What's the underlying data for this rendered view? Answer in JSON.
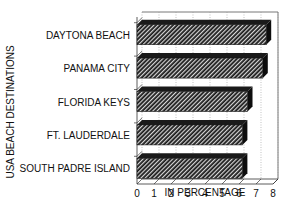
{
  "chart_data": {
    "type": "bar",
    "orientation": "horizontal",
    "style": "3d-hatched",
    "title": "",
    "xlabel": "IN PERCENTAGE",
    "ylabel": "USA BEACH DESTINATIONS",
    "categories": [
      "DAYTONA BEACH",
      "PANAMA CITY",
      "FLORIDA KEYS",
      "FT. LAUDERDALE",
      "SOUTH PADRE ISLAND"
    ],
    "values": [
      7.6,
      7.4,
      6.5,
      6.2,
      6.2
    ],
    "xlim": [
      0,
      8
    ],
    "xticks": [
      "0",
      "1",
      "2",
      "3",
      "4",
      "5",
      "6",
      "7",
      "8"
    ],
    "grid": true,
    "legend": null
  },
  "colors": {
    "bar_dark": "#1a1a1a",
    "bar_hatch_light": "#d8d8d8",
    "axis": "#333333",
    "grid": "#888888"
  }
}
